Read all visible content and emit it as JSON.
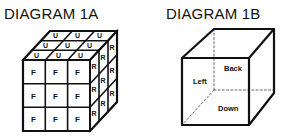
{
  "diagram_1a": {
    "title": "DIAGRAM 1A",
    "front_label": "F",
    "top_label": "U",
    "right_label": "R"
  },
  "diagram_1b": {
    "title": "DIAGRAM 1B",
    "labels": {
      "left": "Left",
      "back": "Back",
      "down": "Down"
    }
  }
}
